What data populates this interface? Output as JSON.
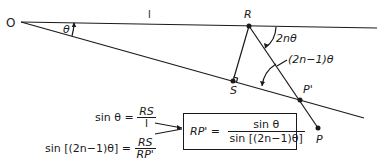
{
  "diagram": {
    "points": {
      "O": "O",
      "R": "R",
      "S": "S",
      "P_prime": "P'",
      "P": "P"
    },
    "labels": {
      "segment_length": "l",
      "angle_theta": "θ",
      "angle_2n_theta": "2nθ",
      "angle_2n_minus_1_theta": "(2n−1)θ"
    },
    "equations": {
      "eq1_lhs": "sin θ =",
      "eq1_num": "RS",
      "eq1_den": "l",
      "eq2_lhs": "sin [(2n−1)θ] =",
      "eq2_num": "RS",
      "eq2_den": "RP'",
      "result_lhs": "RP' =",
      "result_num": "sin θ",
      "result_den": "sin [(2n−1)θ]"
    },
    "colors": {
      "ink": "#1a1a1a",
      "background": "#ffffff"
    }
  }
}
